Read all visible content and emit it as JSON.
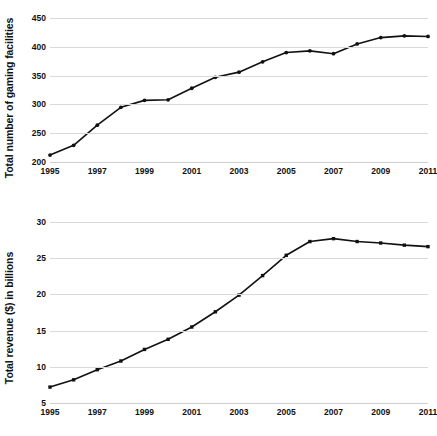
{
  "chart_data": [
    {
      "id": "facilities",
      "type": "line",
      "title": "",
      "xlabel": "",
      "ylabel": "Total number of gaming facilities",
      "x": [
        1995,
        1996,
        1997,
        1998,
        1999,
        2000,
        2001,
        2002,
        2003,
        2004,
        2005,
        2006,
        2007,
        2008,
        2009,
        2010,
        2011
      ],
      "values": [
        212,
        229,
        264,
        295,
        307,
        308,
        328,
        347,
        356,
        374,
        390,
        393,
        388,
        405,
        416,
        419,
        418
      ],
      "xlim": [
        1995,
        2011
      ],
      "ylim": [
        200,
        450
      ],
      "yticks": [
        200,
        250,
        300,
        350,
        400,
        450
      ],
      "ytick_labels": [
        "200",
        "250",
        "300",
        "350",
        "400",
        "450"
      ],
      "xticks": [
        1995,
        1997,
        1999,
        2001,
        2003,
        2005,
        2007,
        2009,
        2011
      ],
      "xtick_labels": [
        "1995",
        "1997",
        "1999",
        "2001",
        "2003",
        "2005",
        "2007",
        "2009",
        "2011"
      ],
      "grid": true,
      "legend": "none",
      "marker": "circle",
      "line_color": "#111111",
      "marker_color": "#111111",
      "grid_color": "#d9d9d9"
    },
    {
      "id": "revenue",
      "type": "line",
      "title": "",
      "xlabel": "",
      "ylabel": "Total revenue ($) in billions",
      "x": [
        1995,
        1996,
        1997,
        1998,
        1999,
        2000,
        2001,
        2002,
        2003,
        2004,
        2005,
        2006,
        2007,
        2008,
        2009,
        2010,
        2011
      ],
      "values": [
        7.2,
        8.2,
        9.6,
        10.8,
        12.4,
        13.8,
        15.5,
        17.6,
        19.9,
        22.6,
        25.4,
        27.3,
        27.7,
        27.3,
        27.1,
        26.8,
        26.6
      ],
      "xlim": [
        1995,
        2011
      ],
      "ylim": [
        5,
        30
      ],
      "yticks": [
        5,
        10,
        15,
        20,
        25,
        30
      ],
      "ytick_labels": [
        "5",
        "10",
        "15",
        "20",
        "25",
        "30"
      ],
      "xticks": [
        1995,
        1997,
        1999,
        2001,
        2003,
        2005,
        2007,
        2009,
        2011
      ],
      "xtick_labels": [
        "1995",
        "1997",
        "1999",
        "2001",
        "2003",
        "2005",
        "2007",
        "2009",
        "2011"
      ],
      "grid": true,
      "legend": "none",
      "marker": "square",
      "line_color": "#111111",
      "marker_color": "#111111",
      "grid_color": "#d9d9d9"
    }
  ]
}
